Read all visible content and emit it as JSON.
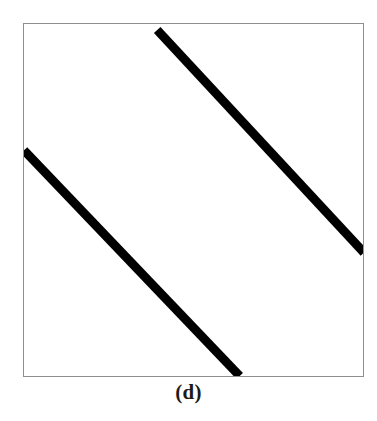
{
  "figure": {
    "caption": "(d)",
    "panel_label": "d",
    "background_color": "#ffffff",
    "frame": {
      "border_color": "#8f8f8f",
      "border_width_px": 1,
      "x": 23,
      "y": 23,
      "width": 341,
      "height": 354
    }
  },
  "chart_data": {
    "type": "line",
    "title": "(d)",
    "subtitle": "",
    "xlabel": "",
    "ylabel": "",
    "grid": false,
    "legend": "none",
    "axis_visible": false,
    "xlim": [
      0,
      341
    ],
    "ylim": [
      0,
      354
    ],
    "stroke_color": "#000000",
    "stroke_width": 9,
    "annotations": [],
    "series": [
      {
        "name": "upper-diagonal-line",
        "color": "#000000",
        "width": 9,
        "x": [
          134,
          342
        ],
        "y": [
          6,
          230
        ]
      },
      {
        "name": "lower-diagonal-line",
        "color": "#000000",
        "width": 9,
        "x": [
          0,
          217
        ],
        "y": [
          127,
          354
        ]
      }
    ]
  }
}
